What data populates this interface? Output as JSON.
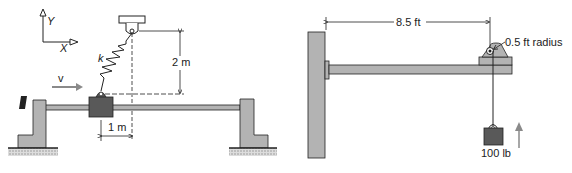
{
  "left_figure": {
    "axes": {
      "y_label": "Y",
      "x_label": "X"
    },
    "spring_label": "k",
    "velocity_label": "v",
    "vertical_dim": "2 m",
    "horizontal_dim": "1 m"
  },
  "right_figure": {
    "span_dim": "8.5 ft",
    "pulley_label": "0.5 ft radius",
    "weight_label": "100 lb"
  },
  "colors": {
    "gray_fill": "#b3b3b3",
    "dark_fill": "#595959",
    "line": "#222222",
    "arrow_gray": "#8a8a8a"
  }
}
